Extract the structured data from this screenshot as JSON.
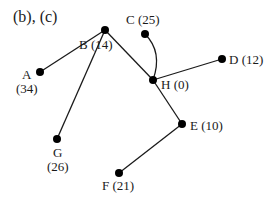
{
  "title": "(b), (c)",
  "colors": {
    "ink": "#1a1a1a",
    "node": "#000000",
    "background": "#ffffff"
  },
  "nodes": [
    {
      "id": "A",
      "value": 34,
      "label_line1": "A",
      "label_line2": "(34)",
      "x": 40,
      "y": 72
    },
    {
      "id": "B",
      "value": 14,
      "label": "B (14)",
      "x": 105,
      "y": 30
    },
    {
      "id": "C",
      "value": 25,
      "label": "C (25)",
      "x": 145,
      "y": 34
    },
    {
      "id": "H",
      "value": 0,
      "label": "H (0)",
      "x": 153,
      "y": 80
    },
    {
      "id": "D",
      "value": 12,
      "label": "D (12)",
      "x": 222,
      "y": 59
    },
    {
      "id": "G",
      "value": 26,
      "label_line1": "G",
      "label_line2": "(26)",
      "x": 57,
      "y": 139
    },
    {
      "id": "E",
      "value": 10,
      "label": "E (10)",
      "x": 182,
      "y": 124
    },
    {
      "id": "F",
      "value": 21,
      "label": "F (21)",
      "x": 119,
      "y": 173
    }
  ],
  "edges": [
    {
      "from": "A",
      "to": "B",
      "curved": false
    },
    {
      "from": "B",
      "to": "H",
      "curved": false
    },
    {
      "from": "B",
      "to": "G",
      "curved": false
    },
    {
      "from": "C",
      "to": "H",
      "curved": true
    },
    {
      "from": "H",
      "to": "D",
      "curved": false
    },
    {
      "from": "H",
      "to": "E",
      "curved": false
    },
    {
      "from": "E",
      "to": "F",
      "curved": false
    }
  ]
}
